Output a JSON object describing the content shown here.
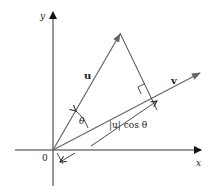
{
  "diagram": {
    "axes": {
      "x_label": "x",
      "y_label": "y",
      "origin_label": "0"
    },
    "vectors": {
      "u": {
        "label": "u"
      },
      "v": {
        "label": "v"
      }
    },
    "angle_label": "θ",
    "projection_label": "|u| cos θ",
    "colors": {
      "axis": "#222222",
      "vector": "#555555",
      "text": "#222222"
    }
  }
}
